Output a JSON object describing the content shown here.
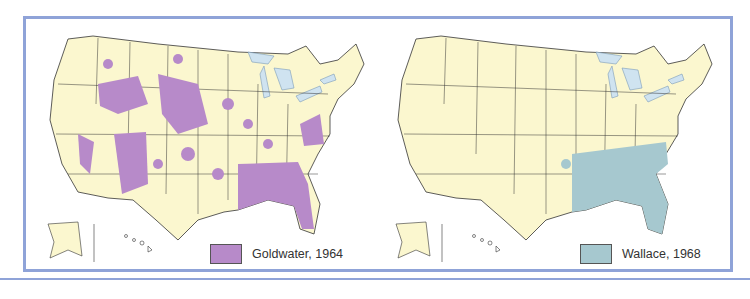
{
  "maps": [
    {
      "id": "goldwater",
      "legend_label": "Goldwater, 1964",
      "color": "#b78ac9"
    },
    {
      "id": "wallace",
      "legend_label": "Wallace, 1968",
      "color": "#a6c8cf"
    }
  ],
  "colors": {
    "land": "#fbf7cf",
    "water": "#cfe3f0",
    "border": "#8fa3d8",
    "state_line": "#333333"
  }
}
